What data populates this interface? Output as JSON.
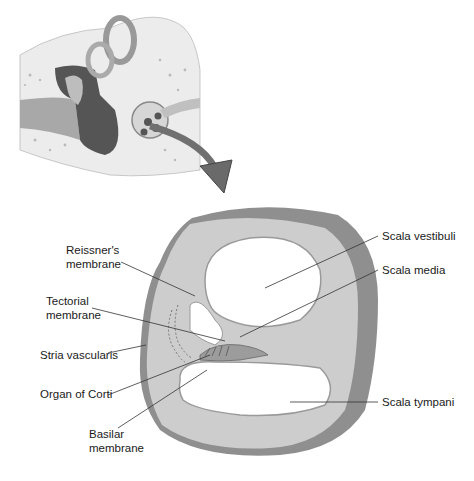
{
  "figure": {
    "inset_title": "Inner ear cross-section (inset)",
    "colors": {
      "bone": "#e8e8e8",
      "tissue": "#bdbdbd",
      "dark_tissue": "#6e6e6e",
      "outer_wall": "#8c8c8c",
      "cochlea_body": "#c9c9c9",
      "label": "#1a1a1a"
    },
    "labels": {
      "reissners_line1": "Reissner's",
      "reissners_line2": "membrane",
      "tectorial_line1": "Tectorial",
      "tectorial_line2": "membrane",
      "stria_vascularis": "Stria vascularis",
      "organ_of_corti": "Organ of Corti",
      "basilar_line1": "Basilar",
      "basilar_line2": "membrane",
      "scala_vestibuli": "Scala vestibuli",
      "scala_media": "Scala media",
      "scala_tympani": "Scala tympani"
    }
  }
}
